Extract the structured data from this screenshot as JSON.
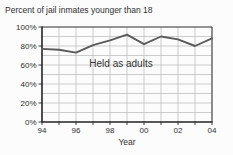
{
  "chart_data": {
    "type": "line",
    "title": "Percent of jail inmates younger than 18",
    "xlabel": "Year",
    "annotation": "Held as adults",
    "years": [
      1994,
      1995,
      1996,
      1997,
      1998,
      1999,
      2000,
      2001,
      2002,
      2003,
      2004
    ],
    "values": [
      77,
      76,
      73,
      81,
      86,
      92,
      82,
      90,
      87,
      80,
      88
    ],
    "series_name": "Held as adults",
    "x_tick_years": [
      1994,
      1996,
      1998,
      2000,
      2002,
      2004
    ],
    "x_tick_labels": [
      "94",
      "96",
      "98",
      "00",
      "02",
      "04"
    ],
    "y_tick_percents": [
      100,
      80,
      60,
      40,
      20,
      0
    ],
    "y_tick_labels": [
      "100%",
      "80%",
      "60%",
      "40%",
      "20%",
      "0%"
    ],
    "ylim": [
      0,
      100
    ],
    "y_grid_step": 10,
    "x_grid_step_years": 1,
    "grid": "on",
    "legend": "none",
    "colors": {
      "line": "#5a5a5a",
      "grid": "#b8b8b8",
      "axis": "#2a2a2a",
      "border": "#444444",
      "text": "#2f2f2f",
      "background": "#fcfcfc"
    }
  }
}
